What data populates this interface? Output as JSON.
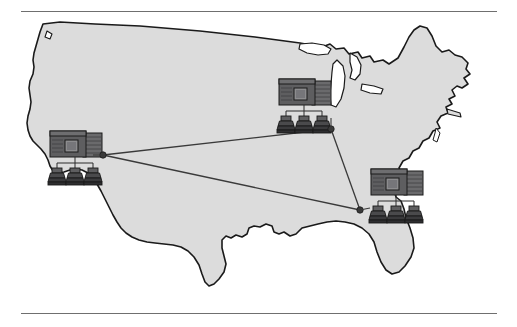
{
  "figure": {
    "background_color": "#ffffff",
    "map_fill_color": "#dcdcdc",
    "map_outline_color": "#1a1a1a",
    "rule_color": "#6f6f6f",
    "link_color": "#3a3a3a",
    "icon_dark_color": "#58585a",
    "icon_shadow_color": "#2e2e30",
    "icon_outline_color": "#1a1a1a",
    "icon_screen_color": "#8c8c8e"
  },
  "rules": {
    "top": {
      "name": "top-divider",
      "x": 21,
      "y": 11,
      "width": 476
    },
    "bottom": {
      "name": "bottom-divider",
      "x": 21,
      "y": 313,
      "width": 476
    }
  },
  "nodes": [
    {
      "id": "west-site",
      "label": "West site",
      "region": "California / West Coast",
      "connector_x": 103,
      "connector_y": 155,
      "icon_x": 48,
      "icon_y": 130,
      "terminals": 3
    },
    {
      "id": "midwest-site",
      "label": "Midwest site",
      "region": "Great Lakes / Upper Midwest",
      "connector_x": 331,
      "connector_y": 129,
      "icon_x": 277,
      "icon_y": 78,
      "terminals": 3
    },
    {
      "id": "southeast-site",
      "label": "Southeast site",
      "region": "Southeast",
      "connector_x": 360,
      "connector_y": 210,
      "icon_x": 369,
      "icon_y": 168,
      "terminals": 3
    }
  ],
  "links": [
    {
      "id": "link-west-midwest",
      "from": "west-site",
      "to": "midwest-site"
    },
    {
      "id": "link-west-southeast",
      "from": "west-site",
      "to": "southeast-site"
    },
    {
      "id": "link-midwest-southeast",
      "from": "midwest-site",
      "to": "southeast-site"
    }
  ],
  "chart_data": {
    "type": "map",
    "sites": [
      {
        "name": "West site",
        "x": 103,
        "y": 155
      },
      {
        "name": "Midwest site",
        "x": 331,
        "y": 129
      },
      {
        "name": "Southeast site",
        "x": 360,
        "y": 210
      }
    ],
    "connections": [
      [
        "West site",
        "Midwest site"
      ],
      [
        "West site",
        "Southeast site"
      ],
      [
        "Midwest site",
        "Southeast site"
      ]
    ],
    "legend": [],
    "annotations": []
  }
}
